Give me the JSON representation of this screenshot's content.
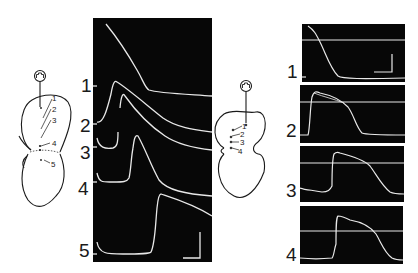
{
  "figure": {
    "left_diagram": {
      "stimulator_symbol": "square-pulse",
      "site_labels": [
        "1",
        "2",
        "3",
        "4",
        "5"
      ]
    },
    "left_panel": {
      "trace_labels": [
        "1",
        "2",
        "3",
        "4",
        "5"
      ],
      "scale_bar": true
    },
    "right_diagram": {
      "stimulator_symbol": "square-pulse",
      "site_labels": [
        "1",
        "2",
        "3",
        "4"
      ]
    },
    "right_panels": {
      "trace_labels": [
        "1",
        "2",
        "3",
        "4"
      ],
      "scale_bar_in_panel": 1
    },
    "colors": {
      "panel_background": "#070707",
      "trace": "#e8e8e8",
      "ink": "#1a1a1a",
      "page": "#ffffff"
    }
  }
}
